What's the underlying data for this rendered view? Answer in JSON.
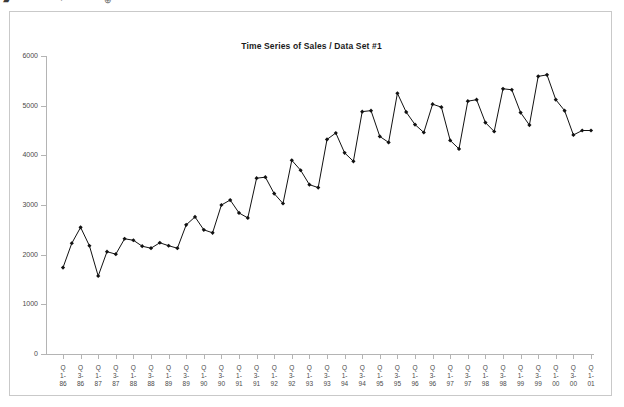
{
  "top_strip": {
    "glyph_left": "▰",
    "glyph_mid": "·",
    "glyph_right": "⊕"
  },
  "figure": {
    "title": "Time Series of Sales / Data Set #1",
    "line_color": "#111111",
    "marker_color": "#111111",
    "axis_color": "#b4b4b4",
    "frame_color": "#c9c9c9",
    "background": "#ffffff"
  },
  "chart_data": {
    "type": "line",
    "title": "Time Series of Sales / Data Set #1",
    "xlabel": "",
    "ylabel": "",
    "ylim": [
      0,
      6000
    ],
    "yticks": [
      0,
      1000,
      2000,
      3000,
      4000,
      5000,
      6000
    ],
    "ytick_labels": [
      "0",
      "1000",
      "2000",
      "3000",
      "4000",
      "5000",
      "6000"
    ],
    "grid": false,
    "legend": false,
    "marker": "filled-diamond",
    "xtick_labels": [
      "Q1-86",
      "Q3-86",
      "Q1-87",
      "Q3-87",
      "Q1-88",
      "Q3-88",
      "Q1-89",
      "Q3-89",
      "Q1-90",
      "Q3-90",
      "Q1-91",
      "Q3-91",
      "Q1-92",
      "Q3-92",
      "Q1-93",
      "Q3-93",
      "Q1-94",
      "Q3-94",
      "Q1-95",
      "Q3-95",
      "Q1-96",
      "Q3-96",
      "Q1-97",
      "Q3-97",
      "Q1-98",
      "Q3-98",
      "Q1-99",
      "Q3-99",
      "Q1-00",
      "Q3-00",
      "Q1-01"
    ],
    "x": [
      "Q1-86",
      "Q2-86",
      "Q3-86",
      "Q4-86",
      "Q1-87",
      "Q2-87",
      "Q3-87",
      "Q4-87",
      "Q1-88",
      "Q2-88",
      "Q3-88",
      "Q4-88",
      "Q1-89",
      "Q2-89",
      "Q3-89",
      "Q4-89",
      "Q1-90",
      "Q2-90",
      "Q3-90",
      "Q4-90",
      "Q1-91",
      "Q2-91",
      "Q3-91",
      "Q4-91",
      "Q1-92",
      "Q2-92",
      "Q3-92",
      "Q4-92",
      "Q1-93",
      "Q2-93",
      "Q3-93",
      "Q4-93",
      "Q1-94",
      "Q2-94",
      "Q3-94",
      "Q4-94",
      "Q1-95",
      "Q2-95",
      "Q3-95",
      "Q4-95",
      "Q1-96",
      "Q2-96",
      "Q3-96",
      "Q4-96",
      "Q1-97",
      "Q2-97",
      "Q3-97",
      "Q4-97",
      "Q1-98",
      "Q2-98",
      "Q3-98",
      "Q4-98",
      "Q1-99",
      "Q2-99",
      "Q3-99",
      "Q4-99",
      "Q1-00",
      "Q2-00",
      "Q3-00",
      "Q4-00",
      "Q1-01"
    ],
    "values": [
      1740,
      2230,
      2550,
      2180,
      1570,
      2060,
      2010,
      2320,
      2290,
      2170,
      2130,
      2240,
      2180,
      2130,
      2600,
      2760,
      2500,
      2440,
      3000,
      3100,
      2840,
      2740,
      3540,
      3560,
      3230,
      3030,
      3900,
      3700,
      3410,
      3350,
      4320,
      4450,
      4050,
      3880,
      4880,
      4900,
      4380,
      4260,
      5250,
      4870,
      4620,
      4460,
      5030,
      4970,
      4300,
      4130,
      5090,
      5120,
      4660,
      4480,
      5340,
      5320,
      4860,
      4610,
      5590,
      5620,
      5120,
      4900,
      4410,
      4500,
      4500
    ]
  }
}
